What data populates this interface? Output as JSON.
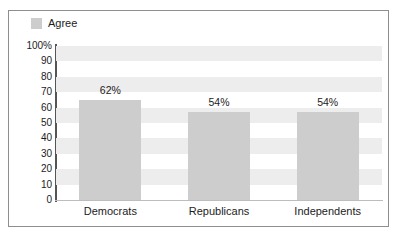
{
  "chart_data": {
    "type": "bar",
    "title": "",
    "xlabel": "",
    "ylabel": "",
    "categories": [
      "Democrats",
      "Republicans",
      "Independents"
    ],
    "values": [
      62,
      54,
      54
    ],
    "value_labels": [
      "62%",
      "54%",
      "54%"
    ],
    "series": [
      {
        "name": "Agree",
        "values": [
          62,
          54,
          54
        ]
      }
    ],
    "ylim": [
      0,
      100
    ],
    "ytick_values": [
      100,
      90,
      80,
      70,
      60,
      50,
      40,
      30,
      20,
      10,
      0
    ],
    "ytick_labels": [
      "100%",
      "90",
      "80",
      "70",
      "60",
      "50",
      "40",
      "30",
      "20",
      "10",
      "0"
    ],
    "grid": "horizontal-bands",
    "legend_position": "top-left",
    "colors": {
      "bar_fill": "#cdcdcd",
      "legend_swatch": "#cdcdcd",
      "band": "#ededed",
      "axis": "#555555",
      "baseline": "#bdbdbd",
      "frame_border": "#8e8e8e",
      "text": "#1c1c1c",
      "background": "#ffffff"
    }
  },
  "legend": {
    "swatch_name": "legend-swatch-agree",
    "label": "Agree"
  }
}
